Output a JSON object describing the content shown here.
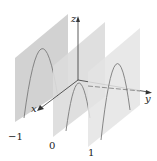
{
  "diagram": {
    "axes": {
      "x_label": "x",
      "y_label": "y",
      "z_label": "z"
    },
    "planes": [
      {
        "label": "−1",
        "value": -1
      },
      {
        "label": "0",
        "value": 0
      },
      {
        "label": "1",
        "value": 1
      }
    ],
    "colors": {
      "plane_fill": "#d6d6d6",
      "plane_fill_light": "#e6e6e6",
      "curve": "#7a7a7a",
      "axis": "#333333"
    }
  }
}
